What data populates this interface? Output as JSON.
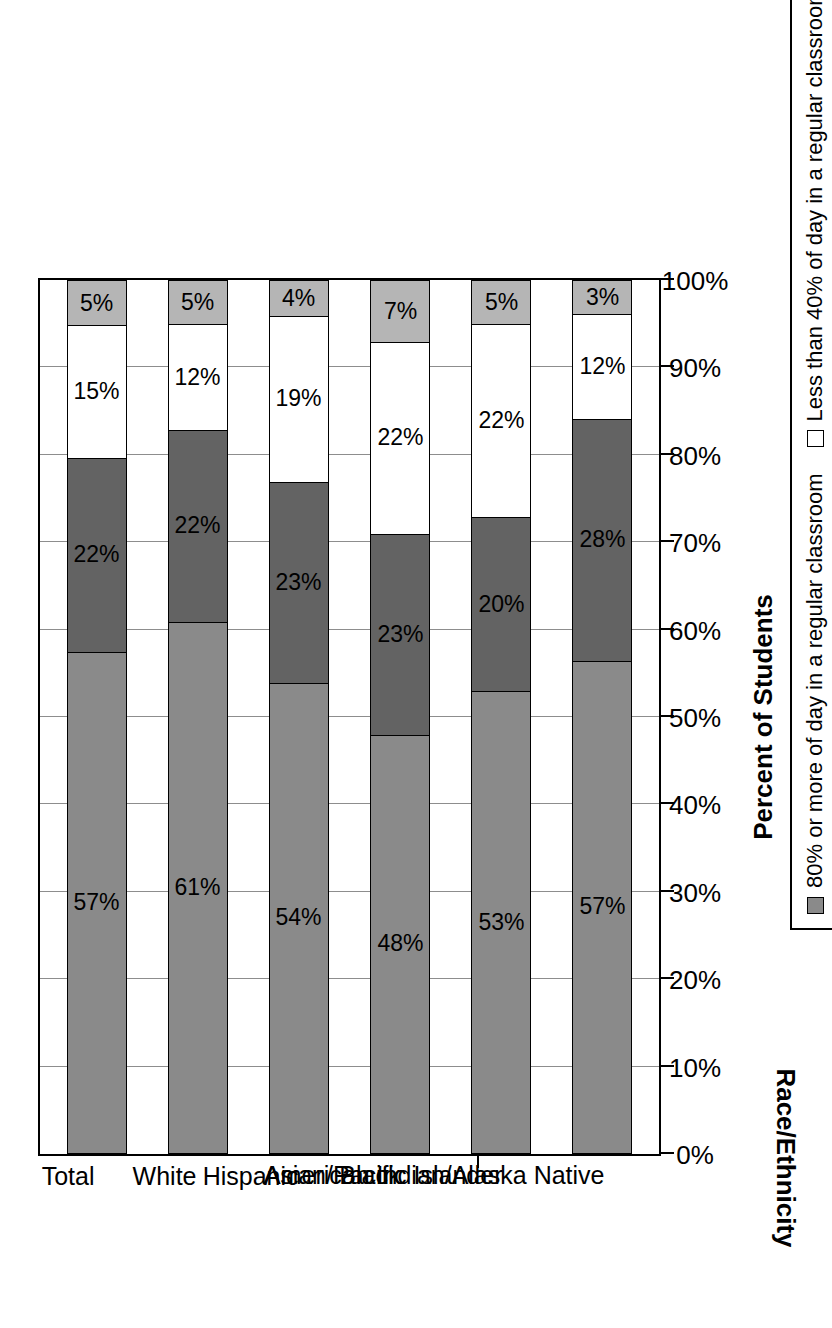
{
  "chart_data": {
    "type": "bar",
    "subtype": "100% stacked horizontal bar",
    "title": "",
    "xlabel": "Percent of Students",
    "ylabel": "Race/Ethnicity",
    "xlim": [
      0,
      100
    ],
    "xticks": [
      "0%",
      "10%",
      "20%",
      "30%",
      "40%",
      "50%",
      "60%",
      "70%",
      "80%",
      "90%",
      "100%"
    ],
    "grid": true,
    "legend_position": "bottom",
    "categories": [
      "Total",
      "White",
      "Hispanic",
      "Black",
      "Asian/Pacific Islander",
      "American Indian/Alaska Native"
    ],
    "series": [
      {
        "name": "80% or more of day in a regular classroom",
        "color": "#8a8a8a",
        "values": [
          57,
          61,
          54,
          48,
          53,
          57
        ],
        "labels": [
          "57%",
          "61%",
          "54%",
          "48%",
          "53%",
          "57%"
        ]
      },
      {
        "name": "70–40% of day in a regular classroom",
        "color": "#636363",
        "values": [
          22,
          22,
          23,
          23,
          20,
          28
        ],
        "labels": [
          "22%",
          "22%",
          "23%",
          "23%",
          "20%",
          "28%"
        ]
      },
      {
        "name": "Less than 40% of day in a regular classroom",
        "color": "#ffffff",
        "values": [
          15,
          12,
          19,
          22,
          22,
          12
        ],
        "labels": [
          "15%",
          "12%",
          "19%",
          "22%",
          "22%",
          "12%"
        ]
      },
      {
        "name": "Not in a regular school",
        "color": "#b5b5b5",
        "values": [
          5,
          5,
          4,
          7,
          5,
          3
        ],
        "labels": [
          "5%",
          "5%",
          "4%",
          "7%",
          "5%",
          "3%"
        ]
      }
    ]
  },
  "axes": {
    "x_title": "Percent of Students",
    "y_title": "Race/Ethnicity"
  },
  "legend": {
    "items": [
      {
        "label": "80% or more of day in a regular classroom",
        "color": "#8a8a8a"
      },
      {
        "label": "70–40% of day in a regular classroom",
        "color": "#636363"
      },
      {
        "label": "Less than 40% of day in a regular classroom",
        "color": "#ffffff"
      },
      {
        "label": "Not in a regular school",
        "color": "#b5b5b5"
      }
    ]
  },
  "colors": {
    "series_1": "#8a8a8a",
    "series_2": "#636363",
    "series_3": "#ffffff",
    "series_4": "#b5b5b5",
    "axis": "#000000",
    "grid": "#8d8d8d",
    "background": "#ffffff"
  }
}
